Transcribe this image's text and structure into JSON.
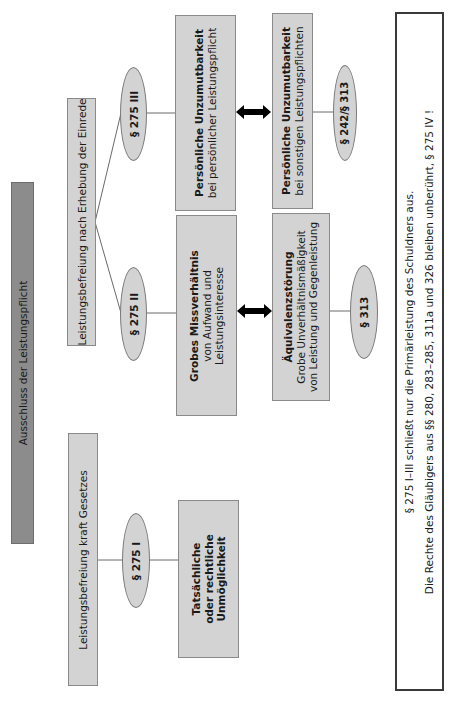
{
  "diagram": {
    "orientation": "rotated-90-ccw",
    "root": {
      "label": "Ausschluss der Leistungspflicht"
    },
    "branches": {
      "einrede": {
        "label": "Leistungsbefreiung nach Erhebung der Einrede"
      },
      "gesetz": {
        "label": "Leistungsbefreiung kraft Gesetzes"
      }
    },
    "paragraphs": {
      "p275_3": "§ 275 III",
      "p275_2": "§ 275 II",
      "p275_1": "§ 275 I",
      "p242_313": "§ 242/§ 313",
      "p313": "§ 313"
    },
    "boxes": {
      "persoenlich": {
        "title": "Persönliche Unzumutbarkeit",
        "sub": "bei persönlicher Leistungspflicht"
      },
      "grob": {
        "line1": "Grobes Missverhältnis",
        "line2": "von Aufwand und",
        "line3": "Leistungsinteresse"
      },
      "unmoeglich": {
        "line1": "Tatsächliche",
        "line2": "oder rechtliche",
        "line3": "Unmöglichkeit"
      },
      "sonstige": {
        "title": "Persönliche Unzumutbarkeit",
        "sub": "bei sonstigen Leistungspflichten"
      },
      "aequivalenz": {
        "title": "Äquivalenzstörung",
        "line2": "Grobe Unverhältnismäßigkeit",
        "line3": "von Leistung und Gegenleistung"
      }
    },
    "note": {
      "line1": "§ 275 I–III schließt nur die Primärleistung des Schuldners aus.",
      "line2": "Die Rechte des Gläubigers aus §§ 280, 283–285, 311a und 326 bleiben unberührt, § 275 IV !"
    },
    "colors": {
      "box_fill": "#d3d3d3",
      "root_fill": "#8c8c8c",
      "border": "#8a8a8a",
      "arrow": "#000000"
    }
  }
}
